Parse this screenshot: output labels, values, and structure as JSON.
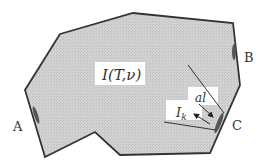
{
  "diagram": {
    "region_label": "I(T,ν)",
    "ports": [
      {
        "id": "A",
        "label": "A"
      },
      {
        "id": "B",
        "label": "B"
      },
      {
        "id": "C",
        "label": "C"
      }
    ],
    "labels": {
      "intensity_in": "I",
      "intensity_in_sub": "k",
      "area_element": "al"
    },
    "colors": {
      "fill": "#cfcfcf",
      "stroke": "#333333",
      "port": "#555555",
      "label_bg": "#ffffff"
    }
  }
}
